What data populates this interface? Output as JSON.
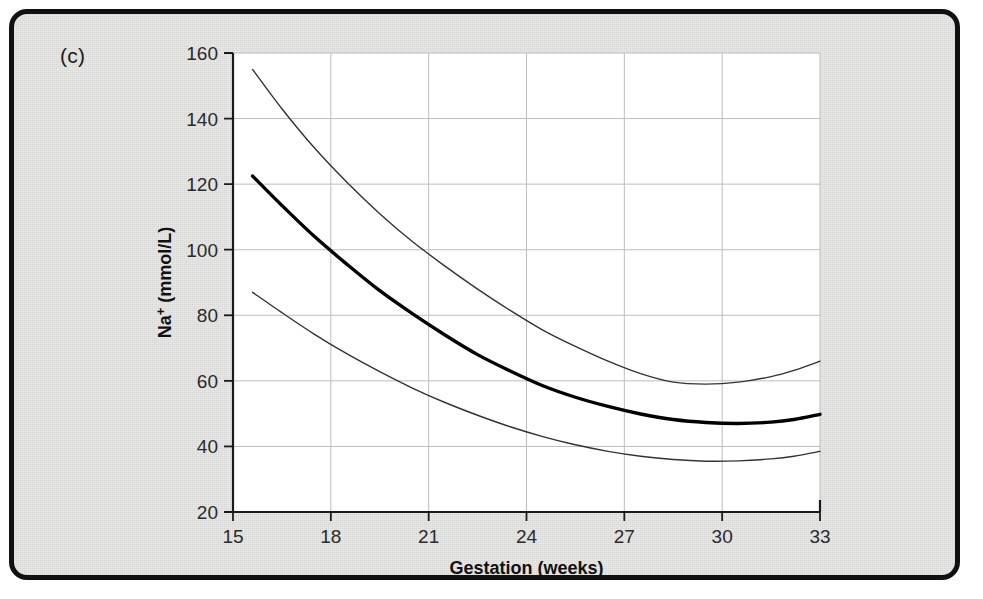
{
  "figure": {
    "panel_label": "(c)",
    "border_color": "#111111",
    "background_color": "#e9e9e7",
    "plot_background_color": "#ffffff"
  },
  "chart_data": {
    "type": "line",
    "title": "",
    "subtitle": "",
    "xlabel": "Gestation (weeks)",
    "ylabel": "Na+ (mmol/L)",
    "ylabel_base": "Na",
    "ylabel_superscript": "+",
    "ylabel_units": " (mmol/L)",
    "xlim": [
      15,
      33
    ],
    "ylim": [
      20,
      160
    ],
    "xticks": [
      15,
      18,
      21,
      24,
      27,
      30,
      33
    ],
    "xtick_labels": [
      "15",
      "18",
      "21",
      "24",
      "27",
      "30",
      "33"
    ],
    "yticks": [
      20,
      40,
      60,
      80,
      100,
      120,
      140,
      160
    ],
    "ytick_labels": [
      "20",
      "40",
      "60",
      "80",
      "100",
      "120",
      "140",
      "160"
    ],
    "grid": true,
    "grid_color": "#bdbdbd",
    "legend": "none",
    "annotations": [
      "(c)"
    ],
    "series": [
      {
        "name": "upper-reference-limit",
        "style": "thin",
        "color": "#333333",
        "line_width": 1.4,
        "x": [
          15.6,
          16.5,
          17.5,
          18.5,
          19.5,
          20.5,
          21.5,
          22.5,
          23.5,
          24.5,
          25.5,
          26.5,
          27.5,
          28.5,
          29.5,
          30.5,
          31.5,
          32.2,
          33.0
        ],
        "values": [
          155.0,
          143.0,
          131.0,
          120.5,
          111.0,
          102.5,
          95.0,
          88.0,
          81.5,
          75.5,
          70.5,
          66.0,
          62.2,
          59.6,
          59.0,
          59.6,
          61.3,
          63.2,
          66.0
        ]
      },
      {
        "name": "median",
        "style": "thick",
        "color": "#000000",
        "line_width": 3.4,
        "x": [
          15.6,
          16.5,
          17.5,
          18.5,
          19.5,
          20.5,
          21.5,
          22.5,
          23.5,
          24.5,
          25.5,
          26.5,
          27.5,
          28.5,
          29.5,
          30.5,
          31.5,
          32.2,
          33.0
        ],
        "values": [
          122.5,
          113.5,
          104.0,
          95.5,
          87.5,
          80.5,
          74.0,
          68.0,
          63.0,
          58.5,
          55.0,
          52.2,
          49.9,
          48.2,
          47.3,
          47.0,
          47.4,
          48.2,
          49.8
        ]
      },
      {
        "name": "lower-reference-limit",
        "style": "thin",
        "color": "#333333",
        "line_width": 1.4,
        "x": [
          15.6,
          16.5,
          17.5,
          18.5,
          19.5,
          20.5,
          21.5,
          22.5,
          23.5,
          24.5,
          25.5,
          26.5,
          27.5,
          28.5,
          29.5,
          30.5,
          31.5,
          32.2,
          33.0
        ],
        "values": [
          87.0,
          80.8,
          74.2,
          68.2,
          62.8,
          57.8,
          53.4,
          49.5,
          46.0,
          43.0,
          40.5,
          38.5,
          37.0,
          36.0,
          35.5,
          35.6,
          36.2,
          37.0,
          38.5
        ]
      }
    ]
  }
}
